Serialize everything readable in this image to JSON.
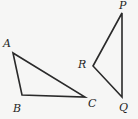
{
  "figure": {
    "background_color": "#f6f6f5",
    "stroke_color": "#2a2a2a",
    "triangles": [
      {
        "name": "ABC",
        "points": "13,53 22,95 85,97",
        "labels": [
          {
            "text": "A",
            "x": 3,
            "y": 47
          },
          {
            "text": "B",
            "x": 13,
            "y": 112
          },
          {
            "text": "C",
            "x": 88,
            "y": 107
          }
        ]
      },
      {
        "name": "PRQ",
        "points": "122,13 93,66 122,97",
        "labels": [
          {
            "text": "P",
            "x": 119,
            "y": 9
          },
          {
            "text": "R",
            "x": 78,
            "y": 68
          },
          {
            "text": "Q",
            "x": 119,
            "y": 111
          }
        ]
      }
    ]
  }
}
